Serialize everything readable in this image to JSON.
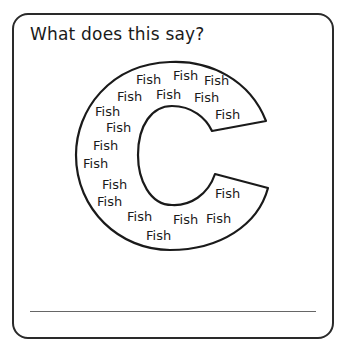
{
  "worksheet": {
    "prompt": "What does this say?",
    "letter": "C",
    "word": "Fish",
    "fish_labels": [
      {
        "text": "Fish",
        "x": 136,
        "y": 73
      },
      {
        "text": "Fish",
        "x": 173,
        "y": 69
      },
      {
        "text": "Fish",
        "x": 204,
        "y": 74
      },
      {
        "text": "Fish",
        "x": 117,
        "y": 90
      },
      {
        "text": "Fish",
        "x": 156,
        "y": 88
      },
      {
        "text": "Fish",
        "x": 194,
        "y": 91
      },
      {
        "text": "Fish",
        "x": 95,
        "y": 105
      },
      {
        "text": "Fish",
        "x": 215,
        "y": 108
      },
      {
        "text": "Fish",
        "x": 106,
        "y": 121
      },
      {
        "text": "Fish",
        "x": 93,
        "y": 139
      },
      {
        "text": "Fish",
        "x": 83,
        "y": 157
      },
      {
        "text": "Fish",
        "x": 102,
        "y": 178
      },
      {
        "text": "Fish",
        "x": 97,
        "y": 195
      },
      {
        "text": "Fish",
        "x": 215,
        "y": 187
      },
      {
        "text": "Fish",
        "x": 127,
        "y": 210
      },
      {
        "text": "Fish",
        "x": 173,
        "y": 213
      },
      {
        "text": "Fish",
        "x": 206,
        "y": 212
      },
      {
        "text": "Fish",
        "x": 146,
        "y": 229
      }
    ],
    "answer_line": ""
  }
}
